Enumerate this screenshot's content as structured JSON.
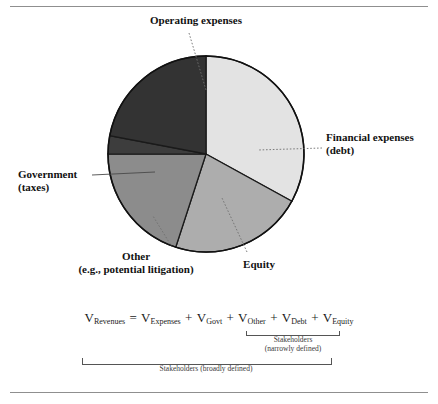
{
  "figure": {
    "labels": {
      "operating": "Operating expenses",
      "financial_line1": "Financial expenses",
      "financial_line2": "(debt)",
      "government_line1": "Government",
      "government_line2": "(taxes)",
      "other_line1": "Other",
      "other_line2": "(e.g., potential litigation)",
      "equity": "Equity"
    },
    "equation": {
      "v": "V",
      "sub_revenues": "Revenues",
      "equals": "=",
      "sub_expenses": "Expenses",
      "plus": "+",
      "sub_govt": "Govt",
      "sub_other": "Other",
      "sub_debt": "Debt",
      "sub_equity": "Equity",
      "full_text": "V Revenues = V Expenses + V Govt + V Other + V Debt + V Equity"
    },
    "annotations": {
      "narrow_line1": "Stakeholders",
      "narrow_line2": "(narrowly defined)",
      "broad": "Stakeholders (broadly defined)"
    }
  },
  "chart_data": {
    "type": "pie",
    "title": "",
    "categories": [
      "Operating expenses",
      "Financial expenses (debt)",
      "Equity",
      "Other (e.g., potential litigation)",
      "Government (taxes)"
    ],
    "values": [
      33,
      22,
      20,
      3,
      22
    ],
    "units": "percent of revenues",
    "colors": [
      "#e3e3e3",
      "#adadad",
      "#8c8c8c",
      "#3d3d3d",
      "#333333"
    ],
    "start_angle_deg": -90,
    "direction": "clockwise",
    "legend": "none (direct labels with leader lines)",
    "grid": false,
    "stroke": "#1a1a1a",
    "slices": [
      {
        "label": "Operating expenses",
        "value": 33,
        "color": "#e3e3e3",
        "label_position": "top"
      },
      {
        "label": "Financial expenses (debt)",
        "value": 22,
        "color": "#adadad",
        "label_position": "right"
      },
      {
        "label": "Equity",
        "value": 20,
        "color": "#8c8c8c",
        "label_position": "bottom"
      },
      {
        "label": "Other (e.g., potential litigation)",
        "value": 3,
        "color": "#3d3d3d",
        "label_position": "bottom-left"
      },
      {
        "label": "Government (taxes)",
        "value": 22,
        "color": "#333333",
        "label_position": "left"
      }
    ]
  }
}
